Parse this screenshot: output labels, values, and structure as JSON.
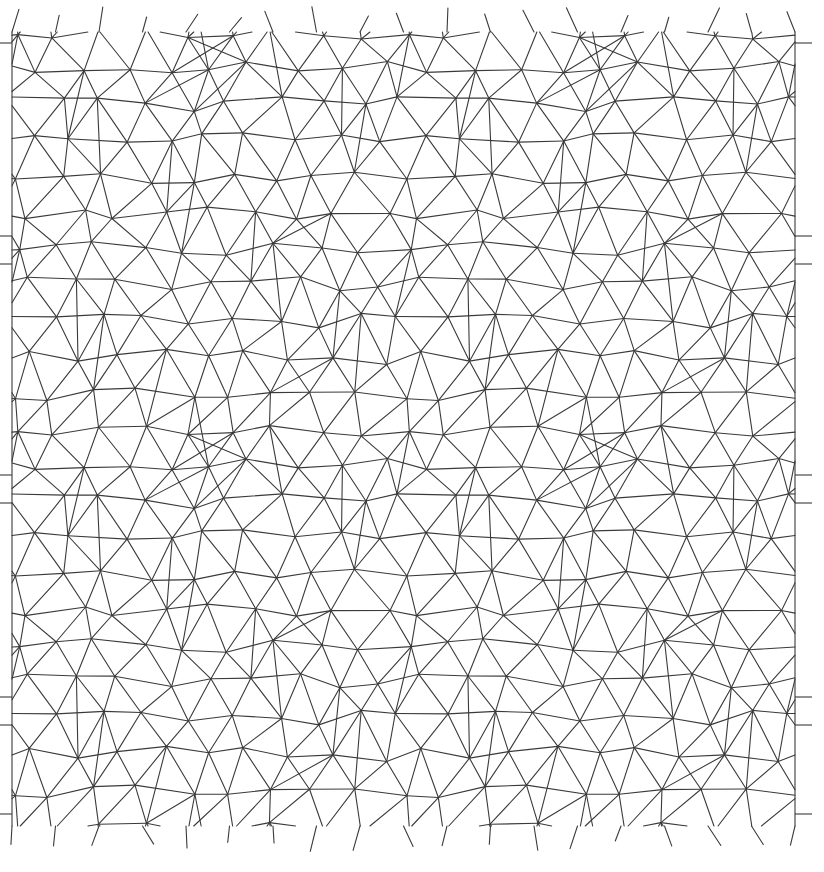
{
  "figure": {
    "kind": "periodic-triangular-mesh",
    "title": "",
    "background_color": "#ffffff",
    "line_color": "#3a3a3a",
    "line_width": 1.1,
    "width": 824,
    "height": 872,
    "has_axes": false,
    "has_labels": false,
    "has_legend": false
  },
  "chart_data": {
    "type": "scatter",
    "title": "",
    "xlabel": "",
    "ylabel": "",
    "grid": false,
    "legend_position": "none",
    "xlim": [
      12,
      795
    ],
    "ylim": [
      32,
      826
    ],
    "plot_box": {
      "left": 12,
      "top": 32,
      "right": 795,
      "bottom": 826
    },
    "tile": {
      "period_x": 391.5,
      "period_y": 397.0,
      "cols": 2,
      "rows": 2,
      "cell_size": 43.5,
      "jitter_amplitude": 0.22
    },
    "edge_count_approx": 1780,
    "vertex_count_approx": 600,
    "boundary_stubs": {
      "left_x": 12,
      "right_x": 795,
      "stub_length": 17,
      "stub_rows": [
        236,
        264,
        475,
        503,
        697,
        725,
        43,
        814
      ]
    },
    "series": [
      {
        "name": "mesh-edges",
        "values": []
      }
    ]
  }
}
